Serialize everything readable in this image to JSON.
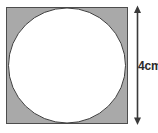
{
  "figure": {
    "background_color": "#ffffff",
    "square": {
      "name": "square",
      "fill_color": "#a9a9a9",
      "stroke_color": "#4d4d4d",
      "stroke_width": 1,
      "x": 6,
      "y": 7,
      "width": 122,
      "height": 117
    },
    "circle": {
      "name": "inscribed-circle",
      "fill_color": "#ffffff",
      "stroke_color": "#3f3f3f",
      "stroke_width": 1,
      "cx": 67,
      "cy": 65.5,
      "r": 58.5
    },
    "dimension": {
      "name": "height-dimension",
      "orientation": "vertical",
      "label": "4cm",
      "value": 4,
      "unit": "cm",
      "line_color": "#3a3a3a",
      "line_x": 137.5,
      "line_top": 7,
      "line_bottom": 123,
      "arrowhead_top": "up",
      "arrowhead_bottom": "down"
    }
  }
}
